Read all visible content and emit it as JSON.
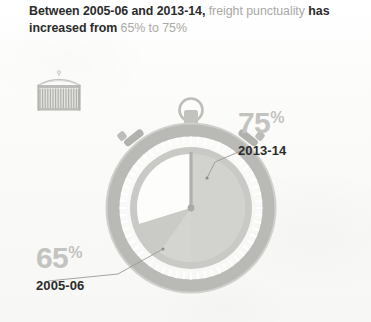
{
  "headline": {
    "segments": [
      {
        "text": "Between 2005-06 and 2013-14,",
        "emphasis": "strong"
      },
      {
        "text": " freight",
        "emphasis": "light"
      },
      {
        "text": " punctuality",
        "emphasis": "light"
      },
      {
        "text": " has increased from",
        "emphasis": "strong"
      },
      {
        "text": " 65% to 75%",
        "emphasis": "light"
      }
    ],
    "line1_strong": "Between 2005-06 and 2013-14,",
    "line1_light": "freight",
    "line2_light": "punctuality",
    "line2_strong": "has increased from",
    "line2_tail_light": "65% to 75%"
  },
  "icons": {
    "container": "shipping-container-icon",
    "stopwatch": "stopwatch-icon"
  },
  "callouts": {
    "later": {
      "value": "75",
      "symbol": "%",
      "period": "2013-14"
    },
    "earlier": {
      "value": "65",
      "symbol": "%",
      "period": "2005-06"
    }
  },
  "colors": {
    "background": "#fbfbfa",
    "text_strong": "#2b2b2b",
    "text_light": "#a9a9a6",
    "percent_label": "#c3c3c0",
    "bezel": "#b9b9b6",
    "bezel_dark": "#a4a4a1",
    "dial_fill": "#d9d9d6",
    "dial_highlight": "#fdfdfc",
    "leader_line": "#9a9a97"
  },
  "chart_data": {
    "type": "pie",
    "title": "Freight punctuality",
    "xlabel": "",
    "ylabel": "",
    "unit": "%",
    "categories": [
      "2005-06",
      "2013-14"
    ],
    "values": [
      65,
      75
    ],
    "series": [
      {
        "name": "2005-06 punctuality",
        "value": 65,
        "label": "65%"
      },
      {
        "name": "2013-14 punctuality",
        "value": 75,
        "label": "75%"
      }
    ],
    "annotations": [
      "2005-06 arc ends at 65% of the dial",
      "2013-14 arc ends at 75% of the dial"
    ],
    "legend_position": "callouts",
    "grid": false
  }
}
